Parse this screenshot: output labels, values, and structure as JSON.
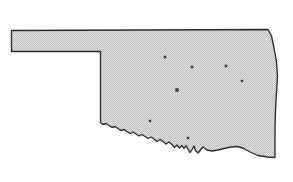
{
  "figure": {
    "kind": "state-outline-map",
    "background_color": "#ffffff",
    "width": 293,
    "height": 182
  },
  "map": {
    "state_name": "Oklahoma",
    "outline": {
      "stroke_color": "#2b2b2b",
      "stroke_width": 1.35,
      "fill_color": "#d9d9d9",
      "fill_style": "stippled-halftone",
      "stipple_dot_color": "#b4b4b4",
      "stipple_spacing": 2
    },
    "regions": [
      {
        "name": "panhandle",
        "description": "narrow rectangular strip extending west"
      },
      {
        "name": "main-body",
        "description": "large rectangular body with jagged southern river border"
      }
    ],
    "borders": [
      {
        "name": "northern-border",
        "type": "straight",
        "description": "horizontal line along the top"
      },
      {
        "name": "western-border",
        "type": "straight",
        "description": "vertical line at west edge of main body"
      },
      {
        "name": "eastern-border",
        "type": "straight",
        "description": "near-vertical line sloping slightly outward"
      },
      {
        "name": "southern-border",
        "type": "jagged",
        "description": "irregular river boundary across the south"
      }
    ],
    "outline_path": "M 11.5,30.5 L 268.0,29.5 L 271.5,36.0 L 274.0,48.0 L 276.5,62.0 L 277.5,76.0 L 276.5,92.0 L 275.5,110.0 L 275.0,130.0 L 275.0,157.5 L 268.0,157.0 L 258.0,155.5 L 250.0,152.0 L 243.0,148.0 L 237.0,146.5 L 231.0,147.0 L 224.0,148.5 L 218.0,150.0 L 212.0,151.0 L 207.0,150.0 L 203.0,147.0 L 200.5,150.0 L 198.0,153.0 L 195.5,150.5 L 194.0,146.0 L 192.0,149.5 L 190.0,152.5 L 188.0,149.0 L 186.0,145.5 L 184.0,148.5 L 182.0,145.5 L 179.5,148.0 L 177.0,145.0 L 174.5,147.5 L 172.0,144.5 L 169.0,142.0 L 166.0,144.0 L 163.0,141.5 L 160.0,139.5 L 157.0,141.5 L 154.0,139.0 L 151.0,137.0 L 148.0,138.5 L 145.0,136.5 L 142.0,134.5 L 139.0,136.0 L 136.0,134.0 L 133.0,132.0 L 130.0,133.5 L 127.0,131.5 L 124.0,129.5 L 121.0,130.5 L 118.0,128.5 L 115.0,126.5 L 112.0,127.5 L 109.0,125.5 L 106.0,123.5 L 103.0,124.5 L 100.5,122.5 L 100.5,51.5 L 11.5,51.5 Z",
    "cities": [
      {
        "name": "city-marker-1",
        "x": 165,
        "y": 57,
        "size": 2.6
      },
      {
        "name": "city-marker-2",
        "x": 192,
        "y": 67,
        "size": 2.6
      },
      {
        "name": "city-marker-3",
        "x": 226,
        "y": 66,
        "size": 2.6
      },
      {
        "name": "city-marker-4",
        "x": 242,
        "y": 81,
        "size": 2.4
      },
      {
        "name": "city-marker-capital",
        "x": 177,
        "y": 90,
        "size": 3.4
      },
      {
        "name": "city-marker-5",
        "x": 150,
        "y": 121,
        "size": 2.4
      },
      {
        "name": "city-marker-6",
        "x": 188,
        "y": 138,
        "size": 2.4
      }
    ],
    "city_dot_color": "#3a3a3a"
  }
}
